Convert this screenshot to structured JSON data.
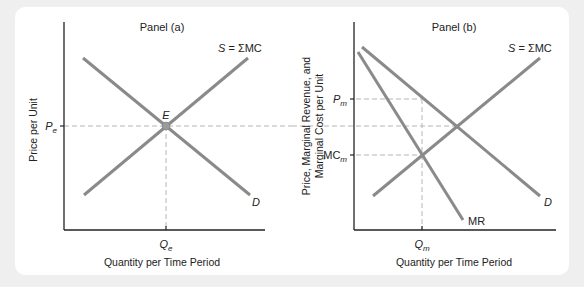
{
  "figure": {
    "panels": [
      {
        "id": "a",
        "title": "Panel (a)",
        "y_axis_label": "Price per Unit",
        "x_axis_label": "Quantity per Time Period",
        "y_tick": {
          "symbol": "P",
          "sub": "e"
        },
        "x_tick": {
          "symbol": "Q",
          "sub": "e"
        },
        "supply_label": {
          "s": "S",
          "rest": " = ΣMC"
        },
        "demand_label": "D",
        "equilibrium_label": "E"
      },
      {
        "id": "b",
        "title": "Panel (b)",
        "y_axis_label_line1": "Price, Marginal Revenue, and",
        "y_axis_label_line2": "Marginal Cost per Unit",
        "x_axis_label": "Quantity per Time Period",
        "y_ticks": [
          {
            "symbol": "P",
            "sub": "m"
          },
          {
            "symbol": "MC",
            "sub": "m"
          }
        ],
        "x_tick": {
          "symbol": "Q",
          "sub": "m"
        },
        "supply_label": {
          "s": "S",
          "rest": " = ΣMC"
        },
        "demand_label": "D",
        "mr_label": "MR"
      }
    ]
  },
  "colors": {
    "curve": "#8a8a8a",
    "axis": "#222222",
    "guide": "#b5b5b5",
    "point": "#9a9a9a"
  }
}
